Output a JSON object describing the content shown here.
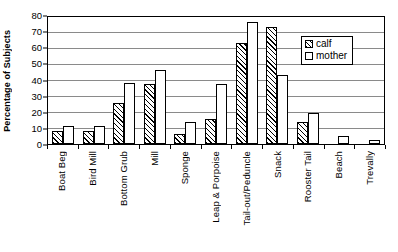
{
  "chart_data": {
    "type": "bar",
    "title": "",
    "xlabel": "",
    "ylabel": "Percentage of Subjects",
    "ylim": [
      0,
      80
    ],
    "ytick_step": 10,
    "yticks": [
      0,
      10,
      20,
      30,
      40,
      50,
      60,
      70,
      80
    ],
    "grid": true,
    "legend_position": "upper-right",
    "categories": [
      "Boat Beg",
      "Bird Mill",
      "Bottom Grub",
      "Mill",
      "Sponge",
      "Leap & Porpoise",
      "Tail-out/Peduncle",
      "Snack",
      "Rooster Tail",
      "Beach",
      "Trevally"
    ],
    "series": [
      {
        "name": "calf",
        "fill": "hatched",
        "values": [
          8,
          8,
          25.5,
          37,
          6,
          15.5,
          62.5,
          72.5,
          13.5,
          0,
          0
        ]
      },
      {
        "name": "mother",
        "fill": "white",
        "values": [
          11,
          11,
          38,
          46,
          13.5,
          37.5,
          75.5,
          43,
          19,
          5,
          2.5
        ]
      }
    ]
  },
  "legend": {
    "entries": [
      {
        "label": "calf"
      },
      {
        "label": "mother"
      }
    ]
  }
}
